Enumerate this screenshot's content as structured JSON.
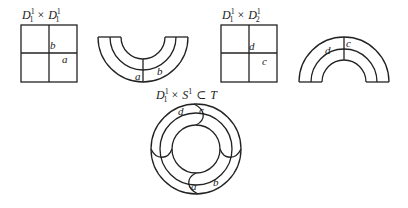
{
  "figures": [
    {
      "id": "square-1",
      "title": {
        "base1": "D",
        "sup1": "1",
        "sub1": "1",
        "op": "×",
        "base2": "D",
        "sup2": "1",
        "sub2": "1"
      },
      "labels": {
        "vertical": "b",
        "horizontal": "a"
      }
    },
    {
      "id": "u-annulus",
      "labels": {
        "left": "a",
        "right": "b"
      }
    },
    {
      "id": "square-2",
      "title": {
        "base1": "D",
        "sup1": "1",
        "sub1": "1",
        "op": "×",
        "base2": "D",
        "sup2": "1",
        "sub2": "2"
      },
      "labels": {
        "vertical": "d",
        "horizontal": "c"
      }
    },
    {
      "id": "arch-annulus",
      "labels": {
        "left": "d",
        "right": "c"
      }
    },
    {
      "id": "torus",
      "title": {
        "base1": "D",
        "sup1": "1",
        "sub1": "1",
        "op": "×",
        "base2": "S",
        "sup2": "1",
        "rel": "⊂",
        "space": "T"
      },
      "labels": {
        "top_left": "d",
        "top_right": "c",
        "bottom_left": "a",
        "bottom_right": "b"
      }
    }
  ]
}
